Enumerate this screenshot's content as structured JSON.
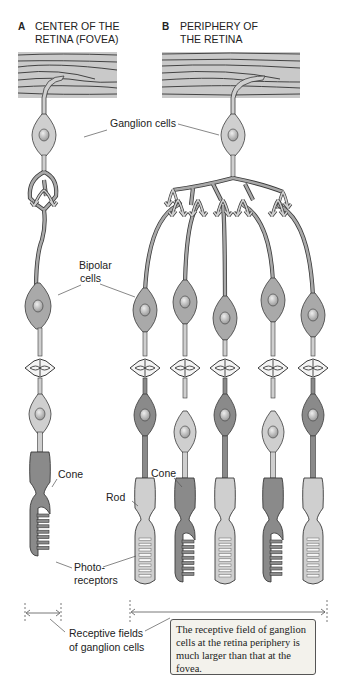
{
  "panels": [
    {
      "letter": "A",
      "title_line1": "CENTER OF THE",
      "title_line2": "RETINA (FOVEA)"
    },
    {
      "letter": "B",
      "title_line1": "PERIPHERY OF",
      "title_line2": "THE RETINA"
    }
  ],
  "labels": {
    "ganglion": "Ganglion cells",
    "bipolar_line1": "Bipolar",
    "bipolar_line2": "cells",
    "cone_a": "Cone",
    "cone_b": "Cone",
    "rod": "Rod",
    "photo_line1": "Photo-",
    "photo_line2": "receptors",
    "receptive_line1": "Receptive fields",
    "receptive_line2": "of ganglion cells"
  },
  "note": "The receptive field of ganglion cells at the retina periphery is much larger than that at the fovea.",
  "colors": {
    "nerve_fiber": "#c9c9c9",
    "cell_light": "#cfcfcf",
    "cell_mid": "#a9a9a9",
    "cell_dark": "#8a8a8a",
    "outline": "#3a3a3a",
    "note_bg": "#f3f2ec"
  },
  "columns": {
    "fovea": [
      {
        "x": 44,
        "type": "cone"
      }
    ],
    "periphery": [
      {
        "x": 145,
        "type": "rod"
      },
      {
        "x": 185,
        "type": "cone"
      },
      {
        "x": 225,
        "type": "rod"
      },
      {
        "x": 273,
        "type": "cone"
      },
      {
        "x": 313,
        "type": "rod"
      }
    ]
  }
}
